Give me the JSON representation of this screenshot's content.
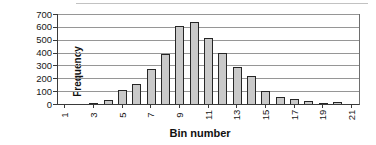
{
  "chart_data": {
    "type": "bar",
    "title": "",
    "xlabel": "Bin number",
    "ylabel": "Frequency",
    "categories": [
      1,
      2,
      3,
      4,
      5,
      6,
      7,
      8,
      9,
      10,
      11,
      12,
      13,
      14,
      15,
      16,
      17,
      18,
      19,
      20,
      21
    ],
    "values": [
      0,
      0,
      10,
      30,
      105,
      155,
      270,
      390,
      610,
      640,
      510,
      395,
      285,
      215,
      100,
      55,
      35,
      20,
      8,
      12,
      0
    ],
    "x_tick_labels": [
      "1",
      "3",
      "5",
      "7",
      "9",
      "11",
      "13",
      "15",
      "17",
      "19",
      "21"
    ],
    "x_tick_bins": [
      1,
      3,
      5,
      7,
      9,
      11,
      13,
      15,
      17,
      19,
      21
    ],
    "y_tick_labels": [
      "0",
      "100",
      "200",
      "300",
      "400",
      "500",
      "600",
      "700"
    ],
    "y_ticks": [
      0,
      100,
      200,
      300,
      400,
      500,
      600,
      700
    ],
    "ylim": [
      0,
      700
    ],
    "grid": "horizontal-on",
    "legend": "none",
    "bar_fill_color": "#c9c9c9",
    "bar_border_color": "#262626",
    "gridline_color": "#969696",
    "axis_color": "#3a3a3a",
    "background_color": "#ffffff"
  }
}
